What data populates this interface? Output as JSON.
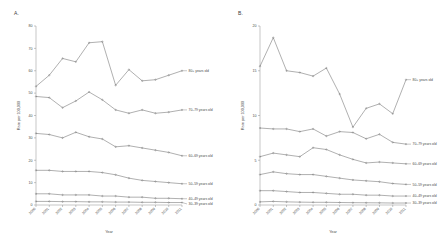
{
  "figure": {
    "panels": [
      {
        "id": "A",
        "label": "A."
      },
      {
        "id": "B",
        "label": "B."
      }
    ]
  },
  "chart_data": [
    {
      "type": "line",
      "panel": "A",
      "title": "A.",
      "xlabel": "Year",
      "ylabel": "Rate per 100,000",
      "x": [
        2000,
        2001,
        2002,
        2003,
        2004,
        2005,
        2006,
        2007,
        2008,
        2009,
        2010,
        2011
      ],
      "categories": [
        "2000",
        "2001",
        "2002",
        "2003",
        "2004",
        "2005",
        "2006",
        "2007",
        "2008",
        "2009",
        "2010",
        "2011"
      ],
      "ylim": [
        0,
        80
      ],
      "yticks": [
        0,
        10,
        20,
        30,
        40,
        50,
        60,
        70,
        80
      ],
      "grid": false,
      "legend_position": "right-inline",
      "series": [
        {
          "name": "80+ years old",
          "values": [
            53.0,
            58.0,
            65.5,
            64.0,
            72.5,
            73.0,
            53.5,
            60.5,
            55.5,
            56.0,
            58.0,
            60.0
          ]
        },
        {
          "name": "70–79 years old",
          "values": [
            48.5,
            48.0,
            43.5,
            46.5,
            50.5,
            47.0,
            42.5,
            41.0,
            42.5,
            41.0,
            41.5,
            42.5
          ]
        },
        {
          "name": "60–69 years old",
          "values": [
            32.0,
            31.5,
            30.0,
            32.5,
            30.5,
            29.5,
            26.0,
            26.5,
            25.5,
            24.5,
            23.5,
            22.0
          ]
        },
        {
          "name": "50–59 years old",
          "values": [
            15.5,
            15.5,
            15.0,
            15.0,
            15.0,
            14.5,
            13.5,
            12.0,
            11.0,
            10.5,
            10.0,
            9.5
          ]
        },
        {
          "name": "40–49 years old",
          "values": [
            5.0,
            5.0,
            4.5,
            4.5,
            4.5,
            4.0,
            4.0,
            3.5,
            3.5,
            3.0,
            3.0,
            2.8
          ]
        },
        {
          "name": "30–39 years old",
          "values": [
            1.6,
            1.6,
            1.5,
            1.5,
            1.4,
            1.4,
            1.3,
            1.3,
            1.2,
            1.2,
            1.1,
            1.1
          ]
        }
      ]
    },
    {
      "type": "line",
      "panel": "B",
      "title": "B.",
      "xlabel": "Year",
      "ylabel": "Rate per 100,000",
      "x": [
        2000,
        2001,
        2002,
        2003,
        2004,
        2005,
        2006,
        2007,
        2008,
        2009,
        2010,
        2011
      ],
      "categories": [
        "2000",
        "2001",
        "2002",
        "2003",
        "2004",
        "2005",
        "2006",
        "2007",
        "2008",
        "2009",
        "2010",
        "2011"
      ],
      "ylim": [
        0,
        20
      ],
      "yticks": [
        0,
        5,
        10,
        15,
        20
      ],
      "grid": false,
      "legend_position": "right-inline",
      "series": [
        {
          "name": "80+ years old",
          "values": [
            15.5,
            18.7,
            15.0,
            14.8,
            14.4,
            15.3,
            12.4,
            8.7,
            10.8,
            11.3,
            10.2,
            14.0
          ]
        },
        {
          "name": "70–79 years old",
          "values": [
            8.6,
            8.5,
            8.5,
            8.2,
            8.5,
            7.7,
            8.2,
            8.1,
            7.4,
            7.9,
            7.0,
            6.8
          ]
        },
        {
          "name": "60–69 years old",
          "values": [
            5.4,
            5.8,
            5.6,
            5.4,
            6.4,
            6.2,
            5.6,
            5.1,
            4.7,
            4.8,
            4.7,
            4.6
          ]
        },
        {
          "name": "50–59 years old",
          "values": [
            3.4,
            3.7,
            3.5,
            3.4,
            3.4,
            3.2,
            3.0,
            2.8,
            2.7,
            2.6,
            2.4,
            2.3
          ]
        },
        {
          "name": "40–49 years old",
          "values": [
            1.6,
            1.6,
            1.5,
            1.4,
            1.4,
            1.3,
            1.2,
            1.2,
            1.1,
            1.1,
            1.0,
            1.0
          ]
        },
        {
          "name": "30–39 years old",
          "values": [
            0.35,
            0.4,
            0.35,
            0.32,
            0.3,
            0.3,
            0.28,
            0.26,
            0.25,
            0.24,
            0.22,
            0.22
          ]
        }
      ]
    }
  ]
}
